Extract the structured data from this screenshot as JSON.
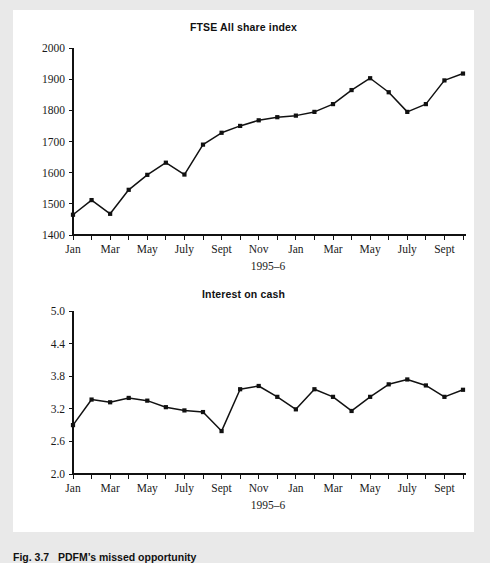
{
  "figure": {
    "caption_label": "Fig. 3.7",
    "caption_text": "PDFM’s missed opportunity",
    "caption_full": "Fig. 3.7   PDFM’s missed opportunity",
    "page_background": "#e9e9e9",
    "canvas_background": "#ffffff",
    "ink_color": "#111111"
  },
  "chart_data": [
    {
      "id": "ftse",
      "type": "line",
      "title": "FTSE All share index",
      "xlabel": "1995–6",
      "ylabel": "",
      "ylim": [
        1400,
        2000
      ],
      "yticks": [
        1400,
        1500,
        1600,
        1700,
        1800,
        1900,
        2000
      ],
      "ytick_labels": [
        "1400",
        "1500",
        "1600",
        "1700",
        "1800",
        "1900",
        "2000"
      ],
      "grid": false,
      "legend": "none",
      "marker": "square",
      "x": [
        1,
        2,
        3,
        4,
        5,
        6,
        7,
        8,
        9,
        10,
        11,
        12,
        13,
        14,
        15,
        16,
        17,
        18,
        19,
        20,
        21,
        22
      ],
      "categories": [
        "Jan",
        "Feb",
        "Mar",
        "Apr",
        "May",
        "June",
        "July",
        "Aug",
        "Sept",
        "Oct",
        "Nov",
        "Dec",
        "Jan",
        "Feb",
        "Mar",
        "Apr",
        "May",
        "June",
        "July",
        "Aug",
        "Sept",
        "Oct"
      ],
      "xtick_labels": [
        "Jan",
        "",
        "Mar",
        "",
        "May",
        "",
        "July",
        "",
        "Sept",
        "",
        "Nov",
        "",
        "Jan",
        "",
        "Mar",
        "",
        "May",
        "",
        "July",
        "",
        "Sept",
        ""
      ],
      "values": [
        1465,
        1512,
        1468,
        1545,
        1593,
        1632,
        1594,
        1690,
        1728,
        1750,
        1768,
        1778,
        1783,
        1795,
        1820,
        1865,
        1903,
        1858,
        1795,
        1820,
        1896,
        1918
      ]
    },
    {
      "id": "interest",
      "type": "line",
      "title": "Interest on cash",
      "xlabel": "1995–6",
      "ylabel": "",
      "ylim": [
        2.0,
        5.0
      ],
      "yticks": [
        2.0,
        2.6,
        3.2,
        3.8,
        4.4,
        5.0
      ],
      "ytick_labels": [
        "2.0",
        "2.6",
        "3.2",
        "3.8",
        "4.4",
        "5.0"
      ],
      "grid": false,
      "legend": "none",
      "marker": "square",
      "x": [
        1,
        2,
        3,
        4,
        5,
        6,
        7,
        8,
        9,
        10,
        11,
        12,
        13,
        14,
        15,
        16,
        17,
        18,
        19,
        20,
        21,
        22
      ],
      "categories": [
        "Jan",
        "Feb",
        "Mar",
        "Apr",
        "May",
        "June",
        "July",
        "Aug",
        "Sept",
        "Oct",
        "Nov",
        "Dec",
        "Jan",
        "Feb",
        "Mar",
        "Apr",
        "May",
        "June",
        "July",
        "Aug",
        "Sept",
        "Oct"
      ],
      "xtick_labels": [
        "Jan",
        "",
        "Mar",
        "",
        "May",
        "",
        "July",
        "",
        "Sept",
        "",
        "Nov",
        "",
        "Jan",
        "",
        "Mar",
        "",
        "May",
        "",
        "July",
        "",
        "Sept",
        ""
      ],
      "values": [
        2.9,
        3.37,
        3.32,
        3.4,
        3.35,
        3.23,
        3.17,
        3.14,
        2.79,
        3.56,
        3.62,
        3.42,
        3.19,
        3.56,
        3.42,
        3.16,
        3.42,
        3.65,
        3.74,
        3.63,
        3.42,
        3.55
      ]
    }
  ]
}
